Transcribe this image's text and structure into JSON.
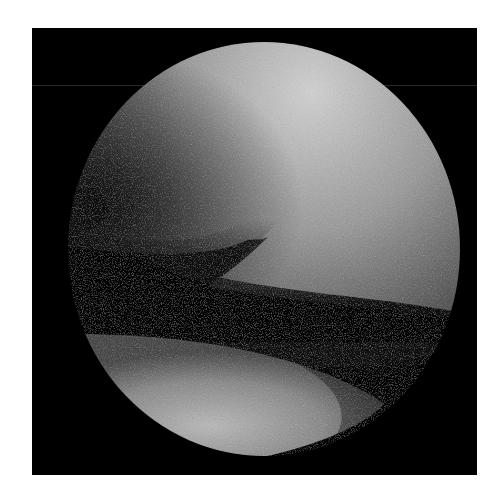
{
  "image": {
    "description": "Grayscale arthroscopic view inside circular endoscope field on black square background",
    "colors": {
      "background": "#ffffff",
      "frame": "#000000",
      "tissue_light": "#bdbdbd",
      "tissue_mid": "#7a7a7a",
      "shadow": "#000000"
    }
  }
}
